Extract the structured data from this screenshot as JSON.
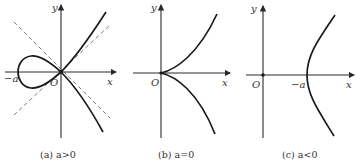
{
  "figure": {
    "panels": [
      {
        "id": "a",
        "caption": "(a) a>0",
        "x_label": "x",
        "y_label": "y",
        "origin_label": "O",
        "point_label": "−a",
        "has_loop": true,
        "has_asymptotes": true
      },
      {
        "id": "b",
        "caption": "(b) a=0",
        "x_label": "x",
        "y_label": "y",
        "origin_label": "O",
        "has_loop": false,
        "has_asymptotes": false
      },
      {
        "id": "c",
        "caption": "(c) a<0",
        "x_label": "x",
        "y_label": "y",
        "origin_label": "O",
        "point_label": "−a",
        "has_loop": false,
        "has_asymptotes": false
      }
    ]
  }
}
